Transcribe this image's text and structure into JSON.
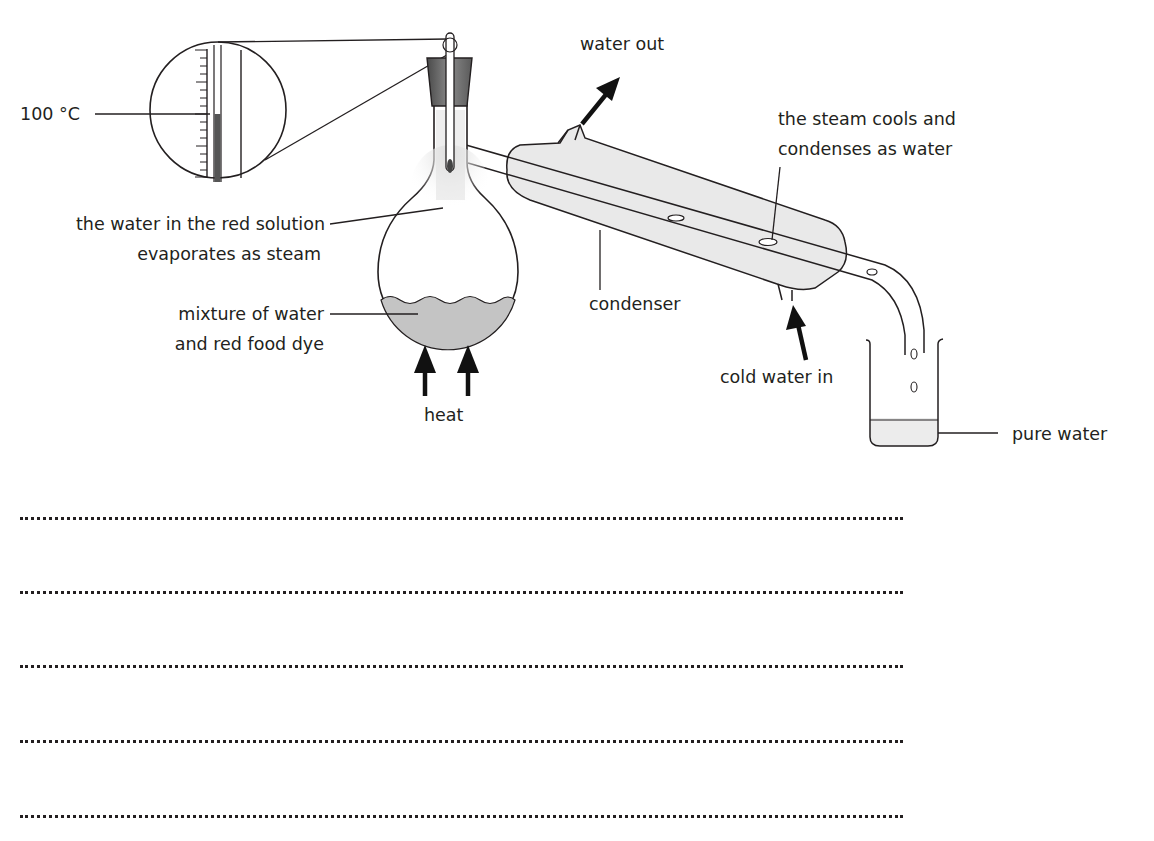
{
  "figure": {
    "labels": {
      "thermometer_reading": "100 °C",
      "steam_line1": "the water in the red solution",
      "steam_line2": "evaporates as steam",
      "mixture_line1": "mixture of water",
      "mixture_line2": "and red food dye",
      "heat": "heat",
      "water_out": "water out",
      "steam_cools_line1": "the steam cools and",
      "steam_cools_line2": "condenses as water",
      "condenser": "condenser",
      "cold_water_in": "cold water in",
      "pure_water": "pure water"
    },
    "components": [
      "thermometer",
      "magnified-thermometer-view",
      "stopper",
      "round-bottom-flask",
      "condenser",
      "delivery-tube",
      "beaker",
      "heat-arrows"
    ],
    "colors": {
      "ink": "#231f20",
      "liquid_fill": "#c8c8c8",
      "glass_fill": "#e9e9e9",
      "stopper_fill": "#6f6f6f"
    }
  },
  "answer_area": {
    "lines": 5
  }
}
